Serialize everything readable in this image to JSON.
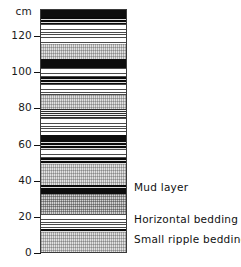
{
  "figure": {
    "type": "stratigraphic-column",
    "unit_label": "cm"
  },
  "axis": {
    "unit": "cm",
    "ticks": [
      {
        "value": 0,
        "label": "0"
      },
      {
        "value": 20,
        "label": "20"
      },
      {
        "value": 40,
        "label": "40"
      },
      {
        "value": 60,
        "label": "60"
      },
      {
        "value": 80,
        "label": "80"
      },
      {
        "value": 100,
        "label": "100"
      },
      {
        "value": 120,
        "label": "120"
      }
    ],
    "range": [
      0,
      135
    ]
  },
  "annotations": [
    {
      "id": "mud-layer",
      "label": "Mud layer",
      "depth_cm": 36
    },
    {
      "id": "horizontal-bedding",
      "label": "Horizontal bedding",
      "depth_cm": 18
    },
    {
      "id": "small-ripple-bedding",
      "label": "Small ripple bedding",
      "depth_cm": 7
    }
  ],
  "chart_data": {
    "type": "bar",
    "title": "",
    "xlabel": "",
    "ylabel": "cm",
    "ylim": [
      0,
      135
    ],
    "orientation": "vertical-log",
    "categories": [
      "0-12",
      "12-14",
      "14-22",
      "22-33",
      "33-36",
      "36-38",
      "38-50",
      "50-53",
      "53-58",
      "58-63",
      "63-66",
      "66-75",
      "75-80",
      "80-88",
      "88-94",
      "94-98",
      "98-103",
      "103-108",
      "108-116",
      "116-127",
      "127-131",
      "131-135"
    ],
    "values": [
      12,
      2,
      8,
      11,
      3,
      2,
      12,
      3,
      5,
      5,
      3,
      9,
      5,
      8,
      6,
      4,
      5,
      5,
      8,
      11,
      4,
      4
    ],
    "series": [
      {
        "name": "lithology",
        "values": [
          "small ripple bedding",
          "mud lamination",
          "horizontal bedding",
          "small ripple bedding",
          "mud layer",
          "mud lamination",
          "small ripple bedding",
          "mud lamination",
          "horizontal bedding",
          "mud lamination",
          "mud layer",
          "horizontal bedding",
          "horizontal bedding dense",
          "small ripple bedding",
          "horizontal bedding",
          "mud lamination",
          "horizontal bedding",
          "mud layer",
          "small ripple bedding",
          "horizontal bedding",
          "mud lamination",
          "mud layer"
        ]
      }
    ],
    "legend_entries": [
      "Mud layer",
      "Horizontal bedding",
      "Small ripple bedding"
    ],
    "grid": false
  },
  "layers": [
    {
      "top_cm": 135,
      "bottom_cm": 131,
      "texture": "t-mud"
    },
    {
      "top_cm": 131,
      "bottom_cm": 127,
      "texture": "t-mud-lam"
    },
    {
      "top_cm": 127,
      "bottom_cm": 116,
      "texture": "t-horiz"
    },
    {
      "top_cm": 116,
      "bottom_cm": 108,
      "texture": "t-ripple"
    },
    {
      "top_cm": 108,
      "bottom_cm": 103,
      "texture": "t-mud"
    },
    {
      "top_cm": 103,
      "bottom_cm": 98,
      "texture": "t-horiz"
    },
    {
      "top_cm": 98,
      "bottom_cm": 94,
      "texture": "t-mud-lam"
    },
    {
      "top_cm": 94,
      "bottom_cm": 88,
      "texture": "t-horiz"
    },
    {
      "top_cm": 88,
      "bottom_cm": 80,
      "texture": "t-ripple"
    },
    {
      "top_cm": 80,
      "bottom_cm": 75,
      "texture": "t-horiz-dense"
    },
    {
      "top_cm": 75,
      "bottom_cm": 66,
      "texture": "t-horiz"
    },
    {
      "top_cm": 66,
      "bottom_cm": 63,
      "texture": "t-mud"
    },
    {
      "top_cm": 63,
      "bottom_cm": 58,
      "texture": "t-mud-lam"
    },
    {
      "top_cm": 58,
      "bottom_cm": 53,
      "texture": "t-horiz"
    },
    {
      "top_cm": 53,
      "bottom_cm": 50,
      "texture": "t-mud-lam"
    },
    {
      "top_cm": 50,
      "bottom_cm": 38,
      "texture": "t-ripple"
    },
    {
      "top_cm": 38,
      "bottom_cm": 36,
      "texture": "t-mud-lam"
    },
    {
      "top_cm": 36,
      "bottom_cm": 33,
      "texture": "t-mud"
    },
    {
      "top_cm": 33,
      "bottom_cm": 22,
      "texture": "t-ripple-dark"
    },
    {
      "top_cm": 22,
      "bottom_cm": 14,
      "texture": "t-horiz"
    },
    {
      "top_cm": 14,
      "bottom_cm": 12,
      "texture": "t-mud-lam"
    },
    {
      "top_cm": 12,
      "bottom_cm": 0,
      "texture": "t-ripple"
    }
  ]
}
